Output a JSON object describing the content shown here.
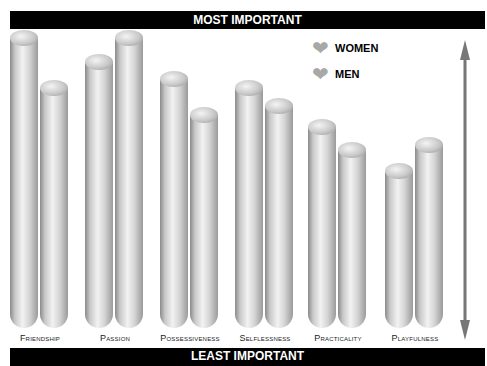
{
  "header": {
    "top_label": "MOST IMPORTANT",
    "bottom_label": "LEAST IMPORTANT"
  },
  "legend": {
    "women": "WOMEN",
    "men": "MEN"
  },
  "chart_data": {
    "type": "bar",
    "title": "",
    "xlabel": "",
    "ylabel": "Importance (Least → Most)",
    "categories": [
      "Friendship",
      "Passion",
      "Possessiveness",
      "Selflessness",
      "Practicality",
      "Playfulness"
    ],
    "series": [
      {
        "name": "WOMEN",
        "values": [
          98,
          90,
          84,
          81,
          68,
          53
        ]
      },
      {
        "name": "MEN",
        "values": [
          81,
          98,
          72,
          75,
          60,
          62
        ]
      }
    ],
    "ylim": [
      0,
      100
    ],
    "grid": false,
    "legend_position": "top-right",
    "annotations": [
      "MOST IMPORTANT",
      "LEAST IMPORTANT"
    ]
  }
}
